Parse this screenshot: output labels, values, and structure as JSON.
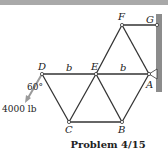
{
  "figure": {
    "caption": "Problem 4/15",
    "load_label": "4000 lb",
    "angle_label": "60°",
    "dimension_labels": [
      "b",
      "b"
    ],
    "joints": [
      {
        "name": "A",
        "x": 149,
        "y": 74
      },
      {
        "name": "B",
        "x": 122,
        "y": 122
      },
      {
        "name": "C",
        "x": 69,
        "y": 122
      },
      {
        "name": "D",
        "x": 42,
        "y": 74
      },
      {
        "name": "E",
        "x": 96,
        "y": 74
      },
      {
        "name": "F",
        "x": 122,
        "y": 25
      },
      {
        "name": "G",
        "x": 157,
        "y": 25
      }
    ],
    "members": [
      [
        "D",
        "E"
      ],
      [
        "E",
        "A"
      ],
      [
        "D",
        "C"
      ],
      [
        "C",
        "E"
      ],
      [
        "E",
        "B"
      ],
      [
        "B",
        "A"
      ],
      [
        "C",
        "B"
      ],
      [
        "E",
        "F"
      ],
      [
        "F",
        "A"
      ],
      [
        "F",
        "G"
      ]
    ],
    "colors": {
      "member": "#333333",
      "wall": "#8c8c8c",
      "load_arrow": "#9a9a9a",
      "top_bar": "#a9a9a9"
    }
  }
}
